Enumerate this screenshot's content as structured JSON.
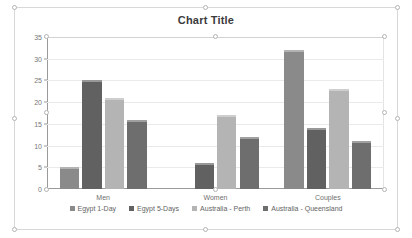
{
  "chart_object": {
    "selected": true,
    "handles": [
      "top-left",
      "top-center",
      "top-right",
      "middle-left",
      "middle-right",
      "bottom-left",
      "bottom-center",
      "bottom-right"
    ]
  },
  "chart_data": {
    "type": "bar",
    "title": "Chart Title",
    "xlabel": "",
    "ylabel": "",
    "categories": [
      "Men",
      "Women",
      "Couples"
    ],
    "series": [
      {
        "name": "Egypt 1-Day",
        "color": "#8a8a8a",
        "values": [
          5,
          0,
          32
        ]
      },
      {
        "name": "Egypt 5-Days",
        "color": "#616161",
        "values": [
          25,
          6,
          14
        ]
      },
      {
        "name": "Australia - Perth",
        "color": "#b4b4b4",
        "values": [
          21,
          17,
          23
        ]
      },
      {
        "name": "Australia - Queensland",
        "color": "#6e6e6e",
        "values": [
          16,
          12,
          11
        ]
      }
    ],
    "ylim": [
      0,
      35
    ],
    "yticks": [
      "0",
      "5",
      "10",
      "15",
      "20",
      "25",
      "30",
      "35"
    ],
    "ytick_values": [
      0,
      5,
      10,
      15,
      20,
      25,
      30,
      35
    ],
    "grid": true,
    "legend_position": "bottom"
  },
  "colors": {
    "plot_border": "#e3e3e3",
    "gridline": "#eaeaea",
    "axis": "#9a9a9a",
    "title_text": "#3b3b3b",
    "tick_text": "#777777",
    "legend_text": "#636363",
    "object_border": "#d8d8d8"
  }
}
